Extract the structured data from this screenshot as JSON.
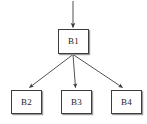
{
  "diagram": {
    "type": "block-hierarchy",
    "title": "",
    "canvas": {
      "width": 147,
      "height": 124,
      "background": "#ffffff"
    },
    "style": {
      "node_fill": "#ffffff",
      "node_border": "#3d3d3d",
      "node_shadow": "#9a9a9a",
      "edge_color": "#4a4a4a",
      "label_color": "#1d1d1d"
    },
    "nodes": [
      {
        "id": "b1",
        "label": "B1",
        "x": 58,
        "y": 29,
        "width": 31,
        "height": 25
      },
      {
        "id": "b2",
        "label": "B2",
        "x": 11,
        "y": 90,
        "width": 31,
        "height": 24
      },
      {
        "id": "b3",
        "label": "B3",
        "x": 61,
        "y": 90,
        "width": 31,
        "height": 24
      },
      {
        "id": "b4",
        "label": "B4",
        "x": 111,
        "y": 90,
        "width": 31,
        "height": 24
      }
    ],
    "edges": [
      {
        "id": "entry-b1",
        "from": "external-input",
        "to": "b1",
        "label": "",
        "direction": "down"
      },
      {
        "id": "b1-b2",
        "from": "b1",
        "to": "b2",
        "label": "",
        "direction": "down-left"
      },
      {
        "id": "b1-b3",
        "from": "b1",
        "to": "b3",
        "label": "",
        "direction": "down"
      },
      {
        "id": "b1-b4",
        "from": "b1",
        "to": "b4",
        "label": "",
        "direction": "down-right"
      }
    ]
  }
}
